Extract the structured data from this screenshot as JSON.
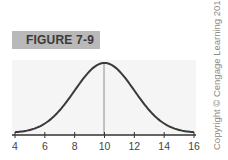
{
  "figure": {
    "label": "FIGURE 7-9"
  },
  "copyright": "Copyright © Cengage Learning 2013",
  "chart_data": {
    "type": "line",
    "title": "FIGURE 7-9",
    "xlabel": "",
    "ylabel": "",
    "xlim": [
      4,
      16
    ],
    "x_ticks": [
      4,
      6,
      8,
      10,
      12,
      14,
      16
    ],
    "tick_labels": [
      "4",
      "6",
      "8",
      "10",
      "12",
      "14",
      "16"
    ],
    "grid": false,
    "legend": null,
    "series": [
      {
        "name": "normal curve",
        "mean": 10,
        "sd": 2,
        "x": [
          4,
          5,
          6,
          7,
          8,
          9,
          10,
          11,
          12,
          13,
          14,
          15,
          16
        ],
        "y_relative": [
          0.011,
          0.044,
          0.135,
          0.325,
          0.607,
          0.882,
          1.0,
          0.882,
          0.607,
          0.325,
          0.135,
          0.044,
          0.011
        ]
      }
    ],
    "annotations": [
      {
        "type": "vertical-line",
        "x": 10
      }
    ],
    "colors": {
      "curve": "#3a3a3a",
      "mean_line": "#8c8c8c",
      "axis": "#333333",
      "background": "#f5f5f5"
    }
  }
}
